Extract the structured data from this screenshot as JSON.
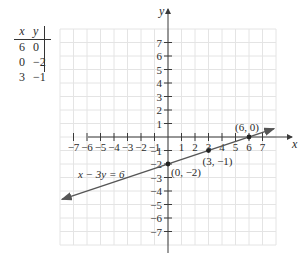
{
  "table": {
    "headers": [
      "x",
      "y"
    ],
    "rows": [
      {
        "x": "6",
        "y": "0"
      },
      {
        "x": "0",
        "y": "−2"
      },
      {
        "x": "3",
        "y": "−1"
      }
    ]
  },
  "chart_data": {
    "type": "line",
    "title": "",
    "xlabel": "x",
    "ylabel": "y",
    "xlim": [
      -8,
      8
    ],
    "ylim": [
      -8,
      8
    ],
    "grid": true,
    "x_ticks": [
      -7,
      -6,
      -5,
      -4,
      -3,
      -2,
      -1,
      1,
      2,
      3,
      4,
      5,
      6,
      7
    ],
    "y_ticks": [
      -7,
      -6,
      -5,
      -4,
      -3,
      -2,
      -1,
      1,
      2,
      3,
      4,
      5,
      6,
      7
    ],
    "series": [
      {
        "name": "x − 3y = 6",
        "equation": "x - 3y = 6",
        "x": [
          -7.85,
          7.85
        ],
        "y": [
          -4.62,
          0.62
        ],
        "arrows": "both"
      }
    ],
    "points": [
      {
        "x": 6,
        "y": 0,
        "label": "(6, 0)"
      },
      {
        "x": 0,
        "y": -2,
        "label": "(0, −2)"
      },
      {
        "x": 3,
        "y": -1,
        "label": "(3, −1)"
      }
    ],
    "annotations": [
      {
        "text": "x − 3y = 6",
        "x": -6.4,
        "y": -2.6
      }
    ]
  },
  "colors": {
    "grid": "#e4e4e4",
    "axis": "#3a3a3a",
    "line": "#555555",
    "point": "#222222",
    "text": "#2b2b2b"
  },
  "labels": {
    "x_axis": "x",
    "y_axis": "y",
    "equation": "x − 3y = 6",
    "p1": "(6, 0)",
    "p2": "(0, −2)",
    "p3": "(3, −1)"
  }
}
